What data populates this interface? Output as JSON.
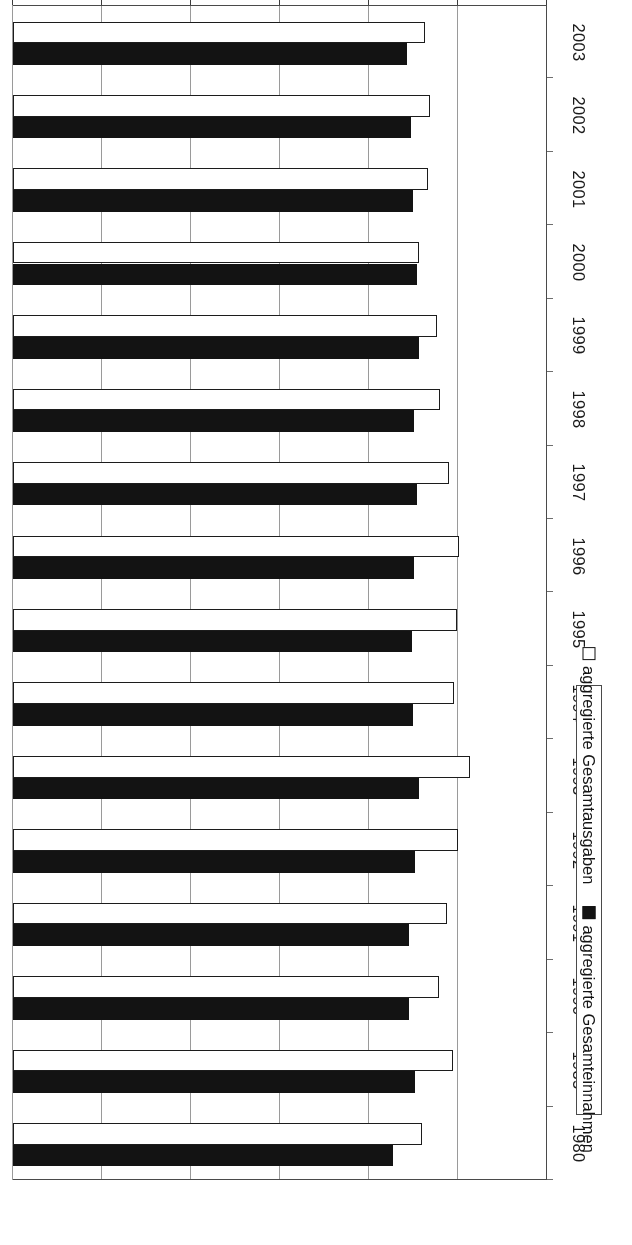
{
  "chart_data": {
    "type": "bar",
    "orientation": "horizontal",
    "title": "",
    "xlabel": "in % des BIP",
    "ylabel": "",
    "xlim": [
      0,
      60
    ],
    "xticks": [
      0,
      10,
      20,
      30,
      40,
      50,
      60
    ],
    "grid": true,
    "legend_position": "bottom-right",
    "categories": [
      "1980",
      "1985",
      "1990",
      "1991",
      "1992",
      "1993",
      "1994",
      "1995",
      "1996",
      "1997",
      "1998",
      "1999",
      "2000",
      "2001",
      "2002",
      "2003"
    ],
    "series": [
      {
        "name": "aggregierte Gesamtausgaben",
        "marker": "hollow-square",
        "color": "#ffffff",
        "values": [
          46.0,
          49.4,
          47.9,
          48.8,
          50.0,
          51.4,
          49.5,
          49.9,
          50.1,
          49.0,
          48.0,
          47.6,
          45.6,
          46.6,
          46.8,
          46.3
        ]
      },
      {
        "name": "aggregierte Gesamteinnahmen",
        "marker": "filled-square",
        "color": "#131313",
        "values": [
          42.7,
          45.2,
          44.5,
          44.5,
          45.2,
          45.6,
          45.0,
          44.8,
          45.1,
          45.4,
          45.1,
          45.6,
          45.4,
          44.9,
          44.7,
          44.3
        ]
      }
    ]
  },
  "axis": {
    "title": "in % des BIP",
    "tick_labels": [
      "60",
      "50",
      "40",
      "30",
      "20",
      "10",
      "0"
    ]
  },
  "legend": {
    "items": [
      {
        "label": "aggregierte Gesamtausgaben",
        "swatch": "hollow-square"
      },
      {
        "label": "aggregierte Gesamteinnahmen",
        "swatch": "filled-square"
      }
    ]
  }
}
